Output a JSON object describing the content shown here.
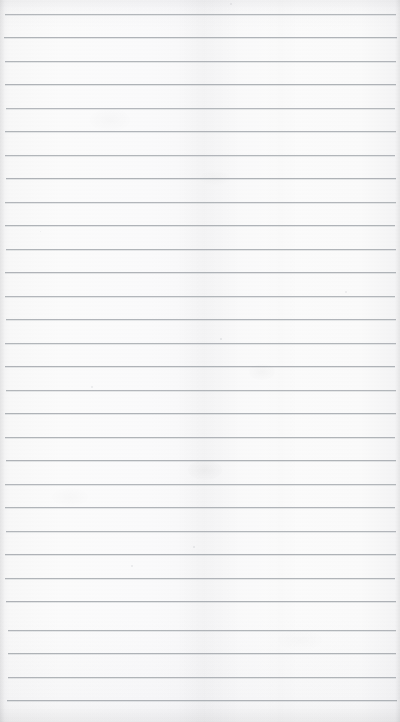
{
  "document": {
    "kind": "scanned-ruled-notebook-page",
    "title": "Blank ruled notebook page",
    "content_text": "",
    "width_px": 400,
    "height_px": 722,
    "paper_color": "#fbfbfb",
    "rule_color": "#a9adb2",
    "background_color": "#6e6e6e"
  },
  "ruling": {
    "style": "horizontal-lines",
    "line_count": 30,
    "first_line_y": 14,
    "line_spacing_px": 23.5,
    "line_thickness_px": 1,
    "left_inset_px": 5,
    "right_inset_px": 4,
    "has_vertical_margin_rule": false,
    "lines": [
      {
        "y": 14,
        "left": 5,
        "right": 396,
        "opacity": 0.85
      },
      {
        "y": 37,
        "left": 4,
        "right": 397,
        "opacity": 0.9
      },
      {
        "y": 61,
        "left": 5,
        "right": 396,
        "opacity": 0.88
      },
      {
        "y": 84,
        "left": 5,
        "right": 396,
        "opacity": 0.92
      },
      {
        "y": 108,
        "left": 6,
        "right": 395,
        "opacity": 0.86
      },
      {
        "y": 131,
        "left": 5,
        "right": 396,
        "opacity": 0.9
      },
      {
        "y": 155,
        "left": 5,
        "right": 395,
        "opacity": 0.88
      },
      {
        "y": 178,
        "left": 6,
        "right": 396,
        "opacity": 0.92
      },
      {
        "y": 202,
        "left": 5,
        "right": 396,
        "opacity": 0.87
      },
      {
        "y": 225,
        "left": 5,
        "right": 395,
        "opacity": 0.9
      },
      {
        "y": 249,
        "left": 6,
        "right": 396,
        "opacity": 0.89
      },
      {
        "y": 272,
        "left": 5,
        "right": 396,
        "opacity": 0.91
      },
      {
        "y": 296,
        "left": 5,
        "right": 395,
        "opacity": 0.87
      },
      {
        "y": 319,
        "left": 6,
        "right": 396,
        "opacity": 0.9
      },
      {
        "y": 343,
        "left": 5,
        "right": 396,
        "opacity": 0.88
      },
      {
        "y": 366,
        "left": 5,
        "right": 395,
        "opacity": 0.91
      },
      {
        "y": 390,
        "left": 6,
        "right": 396,
        "opacity": 0.86
      },
      {
        "y": 413,
        "left": 5,
        "right": 396,
        "opacity": 0.9
      },
      {
        "y": 437,
        "left": 5,
        "right": 395,
        "opacity": 0.89
      },
      {
        "y": 460,
        "left": 6,
        "right": 396,
        "opacity": 0.92
      },
      {
        "y": 484,
        "left": 5,
        "right": 396,
        "opacity": 0.87
      },
      {
        "y": 507,
        "left": 5,
        "right": 395,
        "opacity": 0.9
      },
      {
        "y": 531,
        "left": 6,
        "right": 396,
        "opacity": 0.88
      },
      {
        "y": 554,
        "left": 5,
        "right": 396,
        "opacity": 0.91
      },
      {
        "y": 578,
        "left": 5,
        "right": 395,
        "opacity": 0.89
      },
      {
        "y": 601,
        "left": 6,
        "right": 396,
        "opacity": 0.92
      },
      {
        "y": 630,
        "left": 8,
        "right": 396,
        "opacity": 0.88
      },
      {
        "y": 653,
        "left": 8,
        "right": 396,
        "opacity": 0.9
      },
      {
        "y": 677,
        "left": 8,
        "right": 396,
        "opacity": 0.89
      },
      {
        "y": 700,
        "left": 7,
        "right": 397,
        "opacity": 0.92
      }
    ]
  },
  "marks": {
    "specks": [
      {
        "x": 230,
        "y": 3,
        "size": 2,
        "opacity": 0.3
      },
      {
        "x": 220,
        "y": 338,
        "size": 2,
        "opacity": 0.35
      },
      {
        "x": 193,
        "y": 546,
        "size": 2,
        "opacity": 0.32
      },
      {
        "x": 91,
        "y": 386,
        "size": 1.5,
        "opacity": 0.25
      },
      {
        "x": 345,
        "y": 291,
        "size": 1.5,
        "opacity": 0.22
      },
      {
        "x": 131,
        "y": 565,
        "size": 1.5,
        "opacity": 0.24
      },
      {
        "x": 40,
        "y": 231,
        "size": 1,
        "opacity": 0.2
      }
    ],
    "smudges": [
      {
        "x": 205,
        "y": 470,
        "w": 34,
        "h": 20,
        "opacity": 0.9
      },
      {
        "x": 262,
        "y": 372,
        "w": 26,
        "h": 16,
        "opacity": 0.7
      },
      {
        "x": 110,
        "y": 120,
        "w": 40,
        "h": 22,
        "opacity": 0.5
      },
      {
        "x": 215,
        "y": 178,
        "w": 30,
        "h": 14,
        "opacity": 0.5
      },
      {
        "x": 300,
        "y": 640,
        "w": 44,
        "h": 20,
        "opacity": 0.45
      },
      {
        "x": 70,
        "y": 497,
        "w": 36,
        "h": 18,
        "opacity": 0.45
      }
    ]
  }
}
